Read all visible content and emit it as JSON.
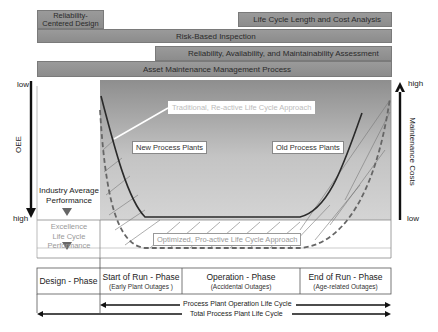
{
  "bars": {
    "rcd": "Reliability-Centered Design",
    "lcca": "Life Cycle Length and Cost Analysis",
    "rbi": "Risk-Based Inspection",
    "ram": "Reliability, Availability, and Maintainability Assessment",
    "ammp": "Asset Maintenance Management Process"
  },
  "left_axis": {
    "label": "OEE",
    "top": "low",
    "bottom": "high"
  },
  "right_axis": {
    "label": "Maintenance Costs",
    "top": "high",
    "bottom": "low"
  },
  "annotations": {
    "traditional": "Traditional, Re-active Life Cycle Approach",
    "optimized": "Optimized, Pro-active Life Cycle Approach",
    "new_plants": "New Process Plants",
    "old_plants": "Old Process Plants",
    "industry_avg_1": "Industry Average",
    "industry_avg_2": "Performance",
    "excellence_1": "Excellence",
    "excellence_2": "Life Cycle",
    "excellence_3": "Performance"
  },
  "phases": [
    {
      "title": "Design - Phase",
      "sub": ""
    },
    {
      "title": "Start of Run - Phase",
      "sub": "(Early Plant Outages )"
    },
    {
      "title": "Operation - Phase",
      "sub": "(Accidental Outages)"
    },
    {
      "title": "End of Run - Phase",
      "sub": "(Age-related Outages)"
    }
  ],
  "lifecycle": {
    "operation": "Process Plant Operation Life Cycle",
    "total": "Total Process Plant Life Cycle"
  }
}
